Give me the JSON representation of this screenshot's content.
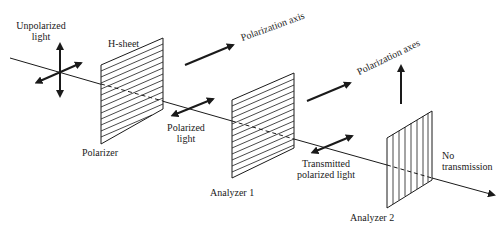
{
  "diagram": {
    "labels": {
      "unpolarized_1": "Unpolarized",
      "unpolarized_2": "light",
      "hsheet": "H-sheet",
      "polarizer": "Polarizer",
      "polarized_1": "Polarized",
      "polarized_2": "light",
      "polarization_axis": "Polarization axis",
      "analyzer1": "Analyzer 1",
      "transmitted_1": "Transmitted",
      "transmitted_2": "polarized light",
      "polarization_axes": "Polarization axes",
      "analyzer2": "Analyzer 2",
      "no_1": "No",
      "no_2": "transmission"
    },
    "elements": [
      {
        "name": "Polarizer",
        "hatching": "horizontal"
      },
      {
        "name": "Analyzer 1",
        "hatching": "horizontal"
      },
      {
        "name": "Analyzer 2",
        "hatching": "vertical"
      }
    ],
    "colors": {
      "ink": "#1a1a1a",
      "background": "#ffffff"
    }
  }
}
